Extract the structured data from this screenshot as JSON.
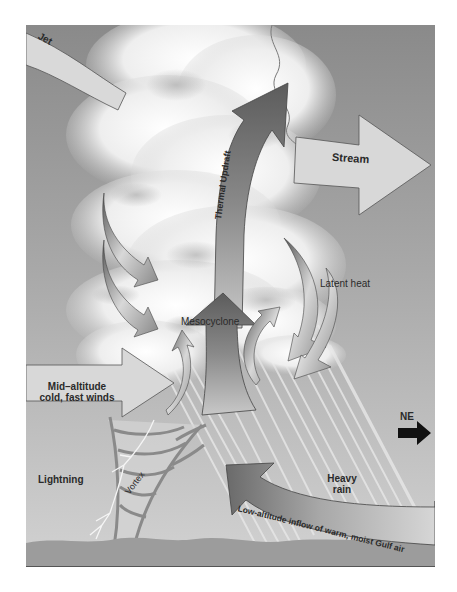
{
  "diagram": {
    "colors": {
      "sky_top": "#8c8c8c",
      "sky_bottom": "#cfcfcf",
      "ground": "#9a9a9a",
      "cloud": "#f2f2f2",
      "arrow_light": "#d9d9d9",
      "arrow_dark": "#6e6e6e",
      "ne_arrow": "#111111"
    },
    "labels": {
      "jet": "Jet",
      "stream": "Stream",
      "thermal_updraft": "Thermal Updraft",
      "latent_heat": "Latent heat",
      "mesocyclone": "Mesocyclone",
      "mid_altitude_line1": "Mid–altitude",
      "mid_altitude_line2": "cold, fast winds",
      "ne": "NE",
      "lightning": "Lightning",
      "vortex": "Vortex",
      "heavy_rain_line1": "Heavy",
      "heavy_rain_line2": "rain",
      "low_altitude_inflow": "Low-altitude inflow of warm, moist Gulf air"
    }
  }
}
